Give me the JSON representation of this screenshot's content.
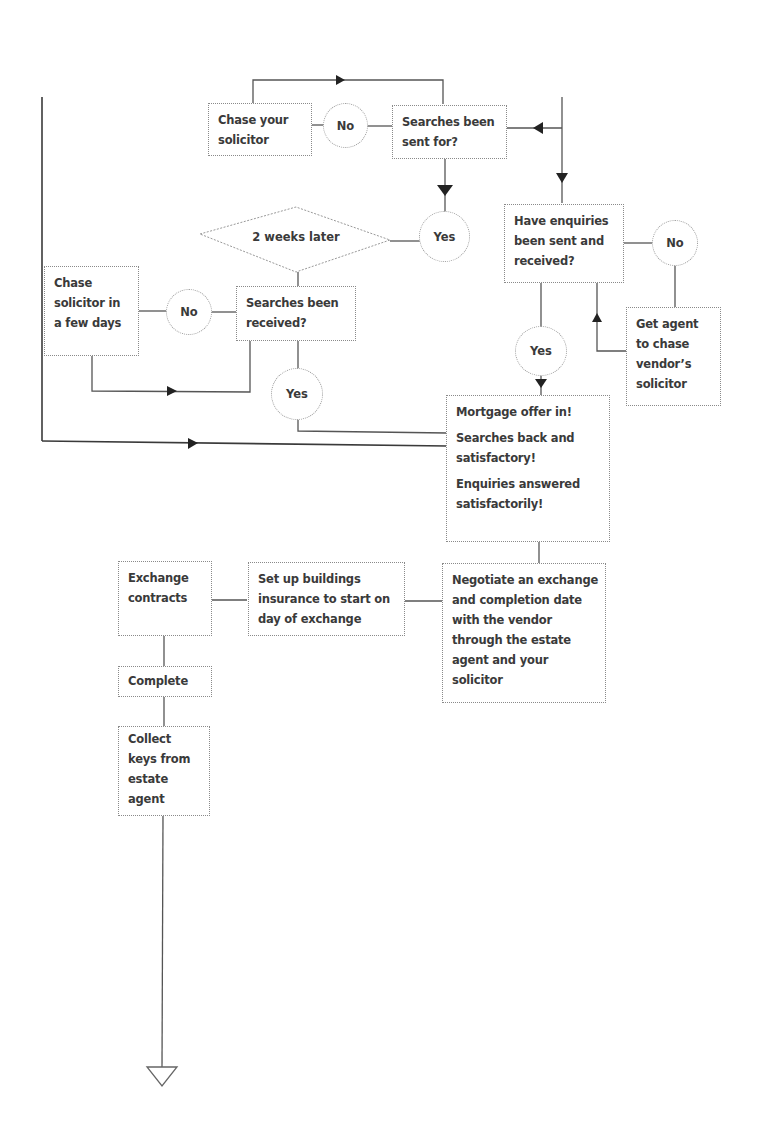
{
  "diagram": {
    "title": "",
    "nodes": {
      "chase_your_solicitor": {
        "lines": [
          "Chase your",
          "solicitor"
        ]
      },
      "searches_sent_for": {
        "lines": [
          "Searches been",
          "sent for?"
        ]
      },
      "two_weeks_later": {
        "label": "2 weeks later"
      },
      "chase_solicitor_few_days": {
        "lines": [
          "Chase",
          "solicitor in",
          "a few days"
        ]
      },
      "searches_received": {
        "lines": [
          "Searches been",
          "received?"
        ]
      },
      "enquiries_sent_received": {
        "lines": [
          "Have enquiries",
          "been sent and",
          "received?"
        ]
      },
      "get_agent_chase": {
        "lines": [
          "Get agent",
          "to chase",
          "vendor’s",
          "solicitor"
        ]
      },
      "status_summary": {
        "paragraphs": [
          [
            "Mortgage offer in!"
          ],
          [
            "Searches back and",
            "satisfactory!"
          ],
          [
            "Enquiries answered",
            "satisfactorily!"
          ]
        ]
      },
      "negotiate_dates": {
        "lines": [
          "Negotiate an exchange",
          "and completion date",
          "with the vendor",
          "through the estate",
          "agent and your",
          "solicitor"
        ]
      },
      "buildings_insurance": {
        "lines": [
          "Set up buildings",
          "insurance to start on",
          "day of exchange"
        ]
      },
      "exchange_contracts": {
        "lines": [
          "Exchange",
          "contracts"
        ]
      },
      "complete": {
        "lines": [
          "Complete"
        ]
      },
      "collect_keys": {
        "lines": [
          "Collect",
          "keys from",
          "estate",
          "agent"
        ]
      }
    },
    "decisions": {
      "no_searches_sent": "No",
      "yes_searches_sent": "Yes",
      "no_searches_received": "No",
      "yes_searches_received": "Yes",
      "no_enquiries": "No",
      "yes_enquiries": "Yes"
    },
    "colors": {
      "line": "#555555",
      "arrow": "#222222",
      "box_border": "#8a8a8a",
      "text": "#3a3a3a",
      "background": "#ffffff"
    }
  }
}
